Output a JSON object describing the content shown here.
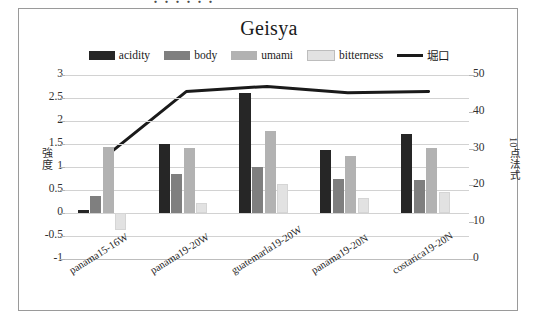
{
  "top_fragment": "・・・・・・",
  "chart_data": {
    "type": "bar",
    "title": "Geisya",
    "categories": [
      "panama15-16W",
      "panama19-20W",
      "guatemarla19-20W",
      "panama19-20N",
      "costarica19-20N"
    ],
    "series": [
      {
        "name": "acidity",
        "values": [
          0.07,
          1.5,
          2.6,
          1.38,
          1.72
        ],
        "color": "#262626",
        "axis": "left",
        "type": "bar"
      },
      {
        "name": "body",
        "values": [
          0.38,
          0.85,
          1.0,
          0.74,
          0.72
        ],
        "color": "#7f7f7f",
        "axis": "left",
        "type": "bar"
      },
      {
        "name": "umami",
        "values": [
          1.43,
          1.41,
          1.78,
          1.25,
          1.42
        ],
        "color": "#b2b2b2",
        "axis": "left",
        "type": "bar"
      },
      {
        "name": "bitterness",
        "values": [
          -0.37,
          0.22,
          0.62,
          0.32,
          0.45
        ],
        "color": "#e2e2e2",
        "axis": "left",
        "type": "bar"
      },
      {
        "name": "堀口",
        "values": [
          27.8,
          45.5,
          46.9,
          45.2,
          45.5
        ],
        "color": "#1a1a1a",
        "axis": "right",
        "type": "line"
      }
    ],
    "ylabel": "強度",
    "ylabel_right": "10点法式",
    "ylim": [
      -1,
      3
    ],
    "yticks": [
      "3",
      "2.5",
      "2",
      "1.5",
      "1",
      "0.5",
      "0",
      "-0.5",
      "-1"
    ],
    "ylim_right": [
      0,
      50
    ],
    "yticks_right": [
      "50",
      "40",
      "30",
      "20",
      "10",
      "0"
    ],
    "grid": true,
    "legend_position": "top"
  },
  "legend": {
    "items": [
      {
        "label": "acidity",
        "marker": "swatch",
        "color": "#262626"
      },
      {
        "label": "body",
        "marker": "swatch",
        "color": "#7f7f7f"
      },
      {
        "label": "umami",
        "marker": "swatch",
        "color": "#b2b2b2"
      },
      {
        "label": "bitterness",
        "marker": "swatch-outlined",
        "color": "#e2e2e2"
      },
      {
        "label": "堀口",
        "marker": "line",
        "color": "#1a1a1a"
      }
    ]
  }
}
